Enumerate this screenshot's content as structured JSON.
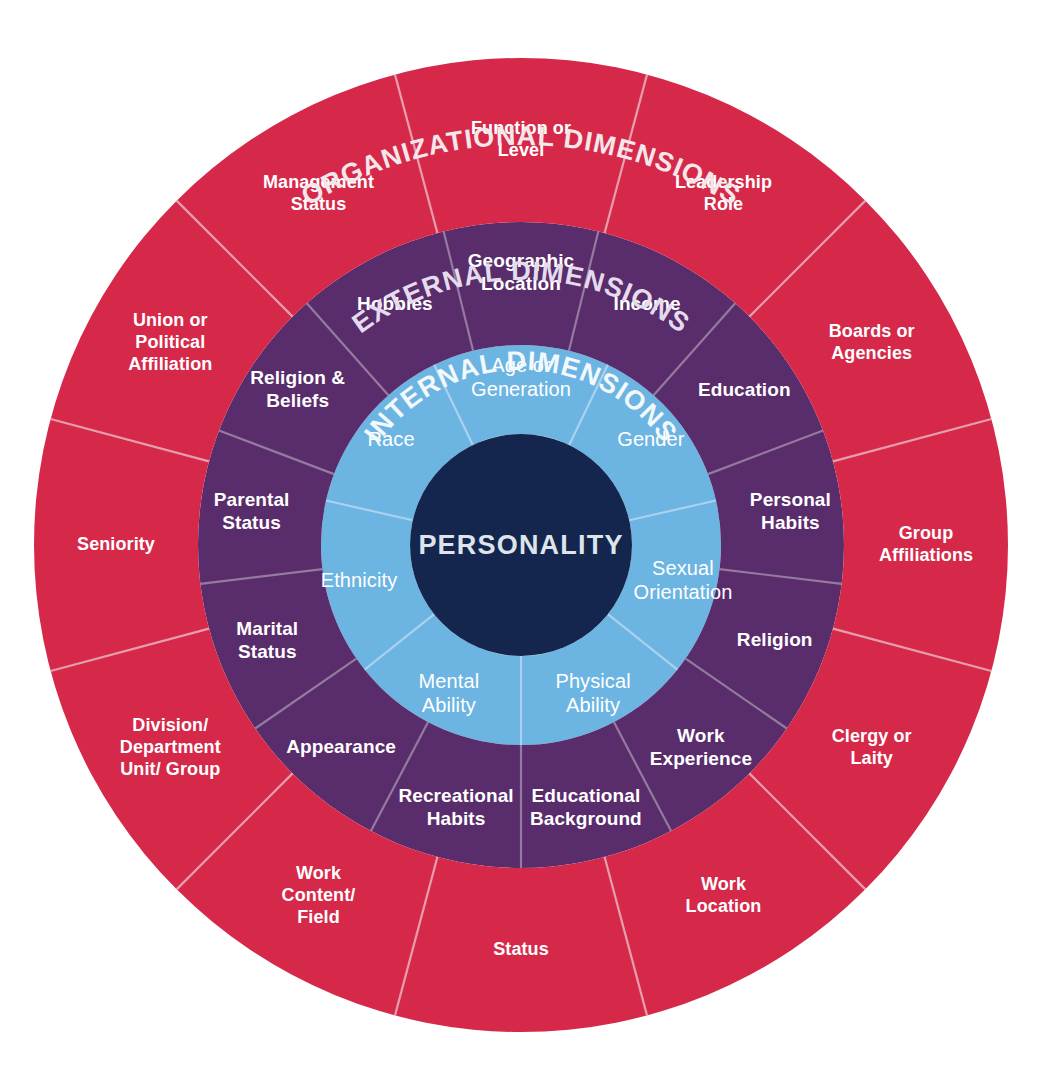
{
  "diagram": {
    "center": {
      "label": "PERSONALITY"
    },
    "colors": {
      "organizational": "#d6294a",
      "external": "#592c6c",
      "internal": "#6cb4e2",
      "core": "#14264e",
      "text": "#ffffff",
      "divider": "#c7b9c9",
      "background": "#ffffff"
    },
    "rings": [
      {
        "id": "internal",
        "title": "INTERNAL DIMENSIONS",
        "color": "#6cb4e2",
        "segments": [
          {
            "label": "Age or Generation"
          },
          {
            "label": "Gender"
          },
          {
            "label": "Sexual Orientation"
          },
          {
            "label": "Physical Ability"
          },
          {
            "label": "Mental Ability"
          },
          {
            "label": "Ethnicity"
          },
          {
            "label": "Race"
          }
        ]
      },
      {
        "id": "external",
        "title": "EXTERNAL DIMENSIONS",
        "color": "#592c6c",
        "segments": [
          {
            "label": "Geographic Location"
          },
          {
            "label": "Income"
          },
          {
            "label": "Education"
          },
          {
            "label": "Personal Habits"
          },
          {
            "label": "Religion"
          },
          {
            "label": "Work Experience"
          },
          {
            "label": "Educational Background"
          },
          {
            "label": "Recreational Habits"
          },
          {
            "label": "Appearance"
          },
          {
            "label": "Marital Status"
          },
          {
            "label": "Parental Status"
          },
          {
            "label": "Religion & Beliefs"
          },
          {
            "label": "Hobbies"
          }
        ]
      },
      {
        "id": "organizational",
        "title": "ORGANIZATIONAL DIMENSIONS",
        "color": "#d6294a",
        "segments": [
          {
            "label": "Function or Level"
          },
          {
            "label": "Leadership Role"
          },
          {
            "label": "Boards or Agencies"
          },
          {
            "label": "Group Affiliations"
          },
          {
            "label": "Clergy or Laity"
          },
          {
            "label": "Work Location"
          },
          {
            "label": "Status"
          },
          {
            "label": "Work Content/ Field"
          },
          {
            "label": "Division/ Department Unit/ Group"
          },
          {
            "label": "Seniority"
          },
          {
            "label": "Union or Political Affiliation"
          },
          {
            "label": "Management Status"
          }
        ]
      }
    ]
  },
  "chart_data": {
    "type": "pie",
    "center_label": "PERSONALITY",
    "rings": [
      {
        "name": "INTERNAL DIMENSIONS",
        "color": "#6cb4e2",
        "inner_radius": 111,
        "outer_radius": 200,
        "categories": [
          "Age or Generation",
          "Gender",
          "Sexual Orientation",
          "Physical Ability",
          "Mental Ability",
          "Ethnicity",
          "Race"
        ],
        "values": [
          1,
          1,
          1,
          1,
          1,
          1,
          1
        ]
      },
      {
        "name": "EXTERNAL DIMENSIONS",
        "color": "#592c6c",
        "inner_radius": 200,
        "outer_radius": 323,
        "categories": [
          "Geographic Location",
          "Income",
          "Education",
          "Personal Habits",
          "Religion",
          "Work Experience",
          "Educational Background",
          "Recreational Habits",
          "Appearance",
          "Marital Status",
          "Parental Status",
          "Religion & Beliefs",
          "Hobbies"
        ],
        "values": [
          1,
          1,
          1,
          1,
          1,
          1,
          1,
          1,
          1,
          1,
          1,
          1,
          1
        ]
      },
      {
        "name": "ORGANIZATIONAL DIMENSIONS",
        "color": "#d6294a",
        "inner_radius": 323,
        "outer_radius": 487,
        "categories": [
          "Function or Level",
          "Leadership Role",
          "Boards or Agencies",
          "Group Affiliations",
          "Clergy or Laity",
          "Work Location",
          "Status",
          "Work Content/ Field",
          "Division/ Department Unit/ Group",
          "Seniority",
          "Union or Political Affiliation",
          "Management Status"
        ],
        "values": [
          1,
          1,
          1,
          1,
          1,
          1,
          1,
          1,
          1,
          1,
          1,
          1
        ]
      }
    ],
    "legend": "none",
    "grid": false
  }
}
